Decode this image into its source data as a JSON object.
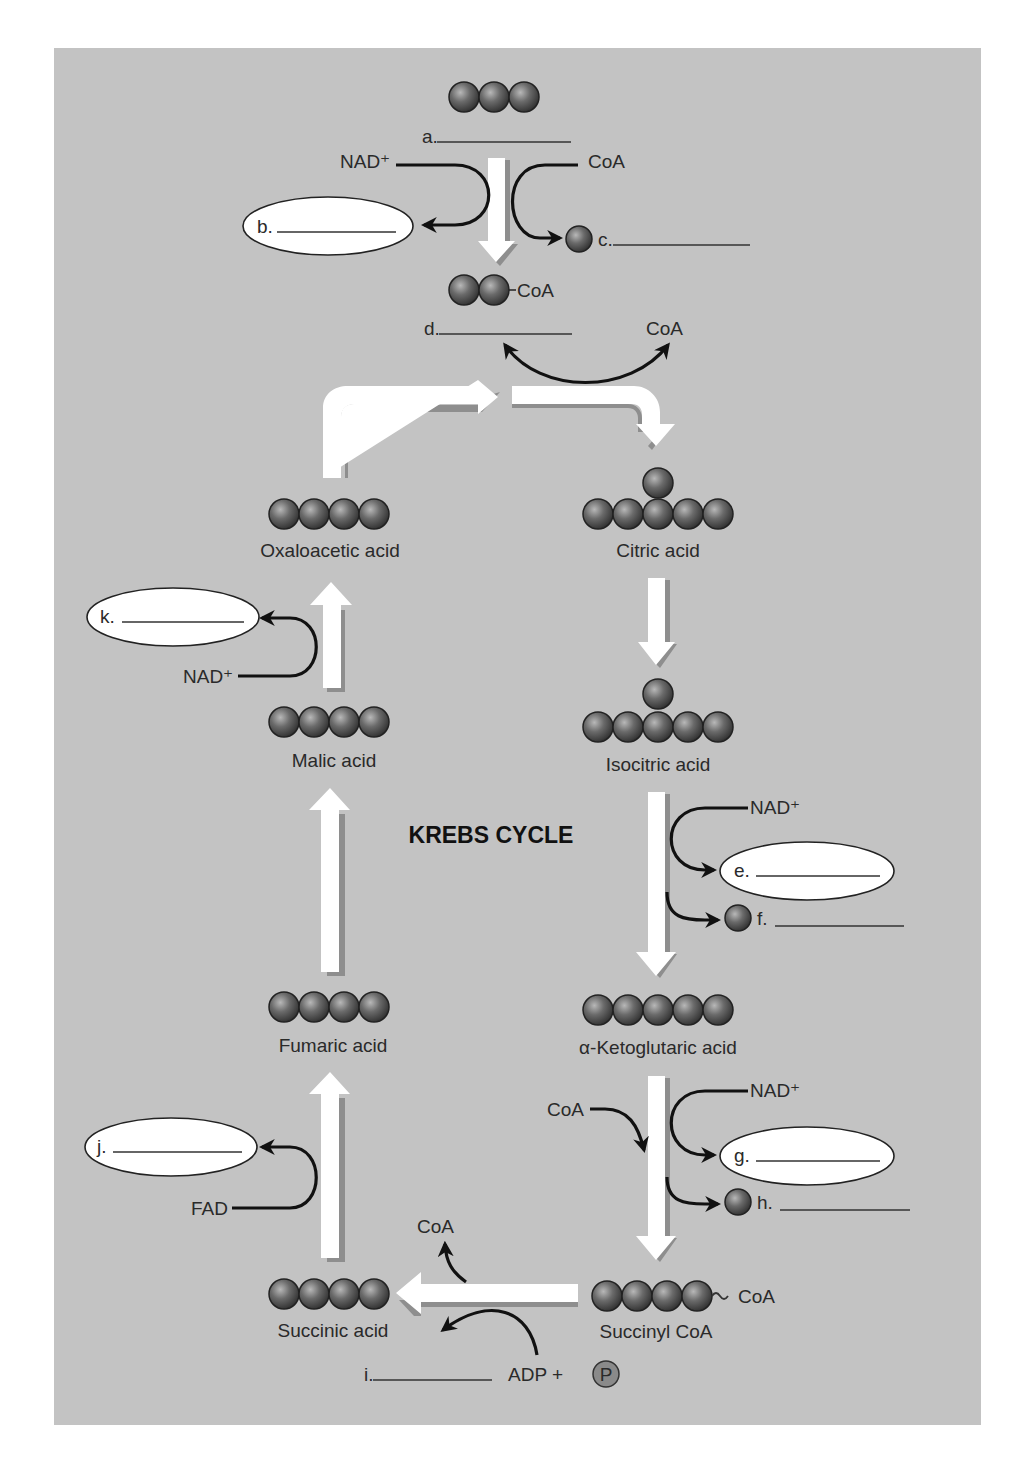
{
  "diagram": {
    "title": "KREBS CYCLE",
    "colors": {
      "background": "#c3c3c3",
      "sphere": "#555555",
      "arrow": "#ffffff",
      "line": "#111111",
      "oval": "#ffffff",
      "phosphate": "#8a8a8a"
    },
    "entry": {
      "carbons": 3,
      "blank_a": "a.",
      "nad_plus": "NAD⁺",
      "coa_in": "CoA",
      "blank_b": "b.",
      "blank_c": "c.",
      "acetyl_coa_label": "CoA",
      "blank_d": "d.",
      "coa_out": "CoA"
    },
    "compounds": {
      "oxaloacetic": {
        "label": "Oxaloacetic acid",
        "carbons": 4
      },
      "citric": {
        "label": "Citric acid",
        "carbons": 6
      },
      "isocitric": {
        "label": "Isocitric acid",
        "carbons": 6
      },
      "ketoglutaric": {
        "label": "α-Ketoglutaric acid",
        "carbons": 5
      },
      "succinyl_coa": {
        "label": "Succinyl CoA",
        "carbons": 4,
        "attached": "CoA"
      },
      "succinic": {
        "label": "Succinic acid",
        "carbons": 4
      },
      "fumaric": {
        "label": "Fumaric acid",
        "carbons": 4
      },
      "malic": {
        "label": "Malic acid",
        "carbons": 4
      }
    },
    "steps": {
      "isocitric_to_keto": {
        "nad": "NAD⁺",
        "blank_e": "e.",
        "blank_f": "f."
      },
      "keto_to_succinyl": {
        "coa_in": "CoA",
        "nad": "NAD⁺",
        "blank_g": "g.",
        "blank_h": "h."
      },
      "succinyl_to_succinic": {
        "coa_out": "CoA",
        "blank_i": "i.",
        "adp": "ADP +",
        "phosphate": "P"
      },
      "succinic_to_fumaric": {
        "fad": "FAD",
        "blank_j": "j."
      },
      "malic_to_oxaloacetic": {
        "nad": "NAD⁺",
        "blank_k": "k."
      }
    }
  }
}
